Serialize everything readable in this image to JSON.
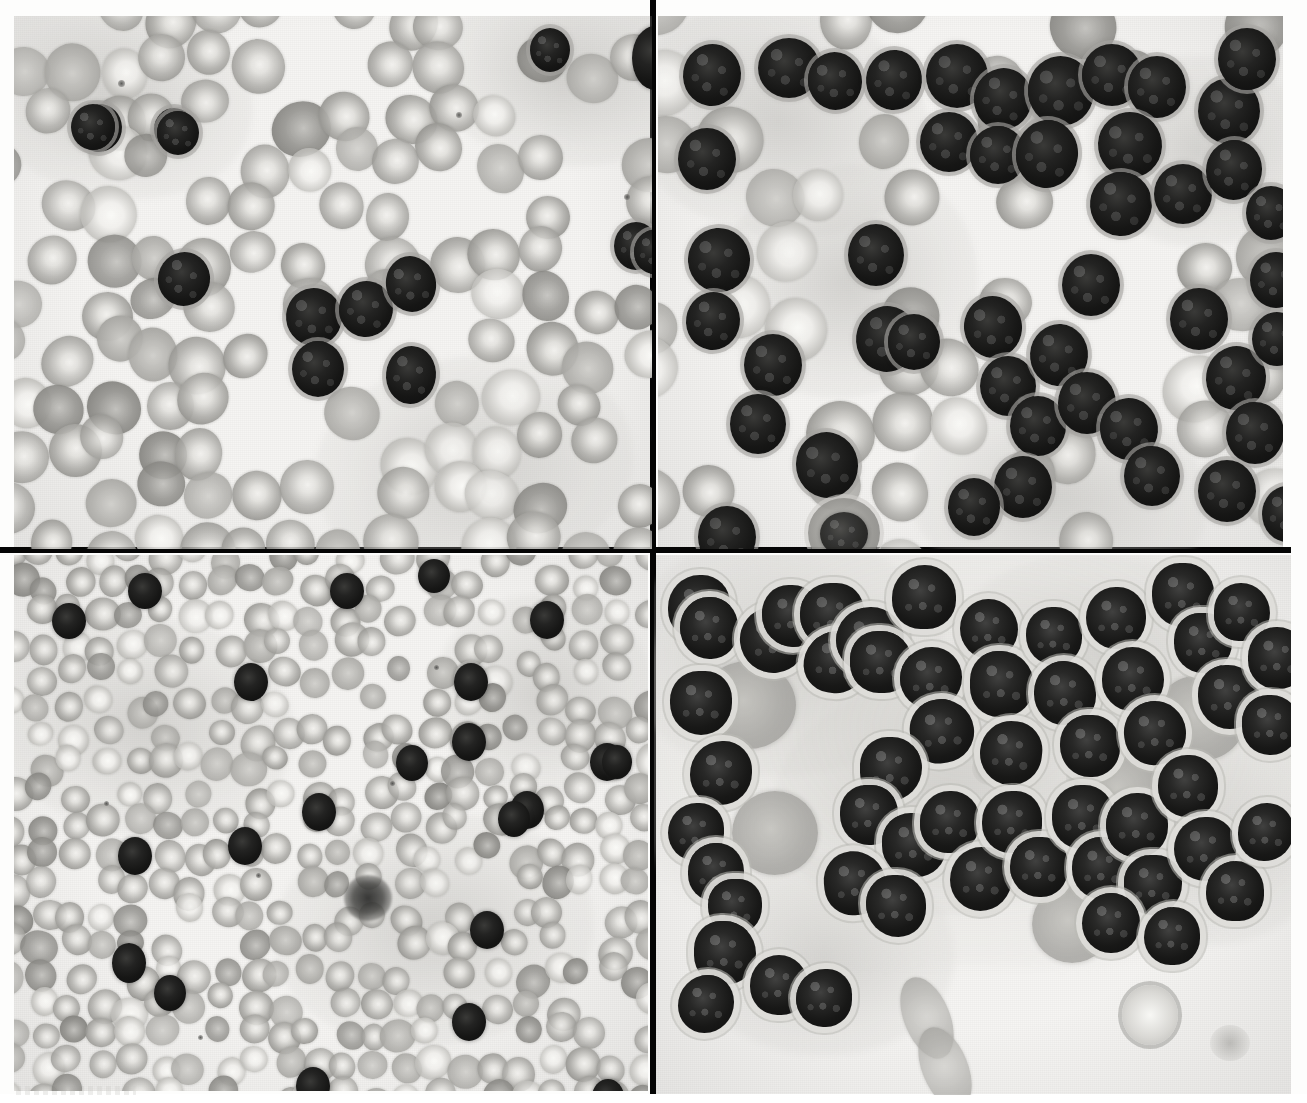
{
  "figure": {
    "kind": "light-microscopy-photomicrograph",
    "stain": "Romanowsky (Wright-Giemsa), reproduced in grayscale",
    "layout": "2 x 2 panel montage separated by black rules",
    "columns": 2,
    "rows": 2,
    "background_color": "#f6f5f3",
    "divider_color": "#050505",
    "page_background": "#fdfdfc"
  },
  "palette": {
    "background": "#f6f5f3",
    "rbc_mid": "#aeadaa",
    "rbc_rim": "#96958f",
    "rbc_center": "#f0efec",
    "nucleus_dark": "#141413",
    "nucleus_mid": "#2a2a28",
    "cytoplasm_gray": "#b9b8b4",
    "divider": "#050505",
    "grain": "#c9c8c5"
  },
  "panels": [
    {
      "id": "panel-a",
      "position": "top-left",
      "label": "",
      "description": "Peripheral blood film, high power. Normochromic red cells with central pallor, scattered small dark-staining lymphoid cells clustered near the centre of the field.",
      "field_type": "peripheral-blood",
      "magnification": "high",
      "rbc_count_visible": 118,
      "dark_cell_count_visible": 6,
      "background_color": "#f7f6f4"
    },
    {
      "id": "panel-b",
      "position": "top-right",
      "label": "",
      "description": "Peripheral blood film, high power. Marked lymphocytosis - numerous medium-sized cells with dense, deeply stained nuclei and scant cytoplasm crowd the field; a single large cell with vacuolated granular cytoplasm lies at lower left.",
      "field_type": "peripheral-blood",
      "magnification": "high",
      "rbc_count_visible": 52,
      "dark_cell_count_visible": 46,
      "background_color": "#f7f6f4"
    },
    {
      "id": "panel-c",
      "position": "bottom-left",
      "label": "",
      "description": "Peripheral blood film, lower power. Dense carpet of small red cells with occasional scattered dark lymphoid cells and one ruptured smudge cell near the centre.",
      "field_type": "peripheral-blood",
      "magnification": "low",
      "rbc_count_visible": 260,
      "dark_cell_count_visible": 20,
      "background_color": "#f7f7f5"
    },
    {
      "id": "panel-d",
      "position": "bottom-right",
      "label": "",
      "description": "Bone marrow aspirate, high power. Sheets of blast cells with large dark nuclei, fine pale cytoplasmic rims, admixed with degenerate cells and two oval red cells at the lower margin.",
      "field_type": "bone-marrow-aspirate",
      "magnification": "high",
      "blast_count_visible": 54,
      "background_color": "#f6f5f2"
    }
  ],
  "dividers": [
    {
      "id": "divider-v",
      "orientation": "vertical",
      "color": "#050505"
    },
    {
      "id": "divider-h",
      "orientation": "horizontal",
      "color": "#050505"
    }
  ],
  "bottom_margin": {
    "visible_text": "",
    "note": "faint scan artefact only, no legible caption"
  }
}
